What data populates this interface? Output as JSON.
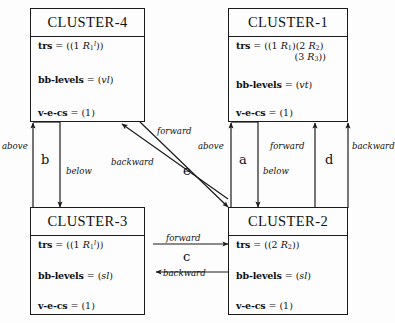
{
  "diagram": {
    "stroke_color": "#1b1b1b",
    "background": "#fdfdfd",
    "clusters": [
      {
        "id": "cluster-4",
        "title": "CLUSTER-4",
        "attributes": [
          {
            "key": "trs",
            "value": "((1 R1l))",
            "value_html": "((1 <i>R</i><sub>1</sub><sup>l</sup>))"
          },
          {
            "key": "bb-levels",
            "value": "(vl)",
            "value_html": "(<i>vl</i>)"
          },
          {
            "key": "v-e-cs",
            "value": "(1)",
            "value_html": "(1)"
          }
        ]
      },
      {
        "id": "cluster-1",
        "title": "CLUSTER-1",
        "attributes": [
          {
            "key": "trs",
            "value": "((1 R1)(2 R2) (3 R3))",
            "value_html": "((1 <i>R</i><sub>1</sub>)(2 <i>R</i><sub>2</sub>)",
            "continuation_html": "(3 <i>R</i><sub>3</sub>))"
          },
          {
            "key": "bb-levels",
            "value": "(vt)",
            "value_html": "(<i>vt</i>)"
          },
          {
            "key": "v-e-cs",
            "value": "(1)",
            "value_html": "(1)"
          }
        ]
      },
      {
        "id": "cluster-3",
        "title": "CLUSTER-3",
        "attributes": [
          {
            "key": "trs",
            "value": "((1 R1l))",
            "value_html": "((1 <i>R</i><sub>1</sub><sup>l</sup>))"
          },
          {
            "key": "bb-levels",
            "value": "(sl)",
            "value_html": "(<i>sl</i>)"
          },
          {
            "key": "v-e-cs",
            "value": "(1)",
            "value_html": "(1)"
          }
        ]
      },
      {
        "id": "cluster-2",
        "title": "CLUSTER-2",
        "attributes": [
          {
            "key": "trs",
            "value": "((2 R2))",
            "value_html": "((2 <i>R</i><sub>2</sub>))"
          },
          {
            "key": "bb-levels",
            "value": "(sl)",
            "value_html": "(<i>sl</i>)"
          },
          {
            "key": "v-e-cs",
            "value": "(1)",
            "value_html": "(1)"
          }
        ]
      }
    ],
    "edge_groups": [
      {
        "id": "b",
        "label": "b",
        "from": "cluster-4",
        "to": "cluster-3",
        "edges": [
          "above",
          "below"
        ]
      },
      {
        "id": "a",
        "label": "a",
        "from": "cluster-1",
        "to": "cluster-2",
        "edges": [
          "above",
          "below"
        ]
      },
      {
        "id": "d",
        "label": "d",
        "from": "cluster-2",
        "to": "cluster-1",
        "edges": [
          "forward",
          "backward"
        ]
      },
      {
        "id": "c",
        "label": "c",
        "from": "cluster-3",
        "to": "cluster-2",
        "edges": [
          "forward",
          "backward"
        ]
      },
      {
        "id": "e",
        "label": "e",
        "from": "cluster-4",
        "to": "cluster-2",
        "edges": [
          "forward",
          "backward"
        ]
      }
    ],
    "edge_labels": {
      "above_left": "above",
      "below_left": "below",
      "above_right": "above",
      "below_right": "below",
      "forward_right": "forward",
      "backward_right": "backward",
      "forward_bottom": "forward",
      "backward_bottom": "backward",
      "forward_diag": "forward",
      "backward_diag": "backward"
    },
    "group_labels": {
      "b": "b",
      "a": "a",
      "d": "d",
      "c": "c",
      "e": "e"
    }
  }
}
